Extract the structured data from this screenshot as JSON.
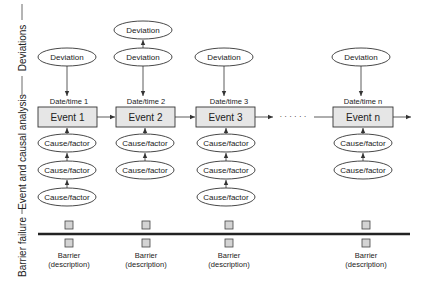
{
  "side_labels": {
    "deviations": "Deviations",
    "event_causal": "Event and causal analysis",
    "barrier": "Barrier failure"
  },
  "columns": [
    {
      "deviations": [
        "Deviation"
      ],
      "date": "Date/time 1",
      "event": "Event 1",
      "causes": [
        "Cause/factor",
        "Cause/factor",
        "Cause/factor"
      ],
      "barrier": {
        "line1": "Barrier",
        "line2": "(description)"
      }
    },
    {
      "deviations": [
        "Deviation",
        "Deviation"
      ],
      "date": "Date/time 2",
      "event": "Event 2",
      "causes": [
        "Cause/factor",
        "Cause/factor"
      ],
      "barrier": {
        "line1": "Barrier",
        "line2": "(description)"
      }
    },
    {
      "deviations": [
        "Deviation"
      ],
      "date": "Date/time 3",
      "event": "Event 3",
      "causes": [
        "Cause/factor",
        "Cause/factor",
        "Cause/factor"
      ],
      "barrier": {
        "line1": "Barrier",
        "line2": "(description)"
      }
    },
    {
      "deviations": [
        "Deviation"
      ],
      "date": "Date/time n",
      "event": "Event n",
      "causes": [
        "Cause/factor",
        "Cause/factor"
      ],
      "barrier": {
        "line1": "Barrier",
        "line2": "(description)"
      }
    }
  ],
  "ellipsis": "· · · · · ·",
  "colors": {
    "event_fill": "#e6e6e6",
    "barrier_fill": "#d4d4d4",
    "line": "#333333",
    "barrier_line": "#222222"
  }
}
